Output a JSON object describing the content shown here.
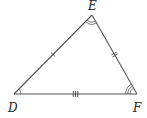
{
  "figure": {
    "type": "triangle",
    "vertices": [
      {
        "name": "D",
        "x": 14,
        "y": 94,
        "label_x": 8,
        "label_y": 112
      },
      {
        "name": "E",
        "x": 92,
        "y": 15,
        "label_x": 88,
        "label_y": 10
      },
      {
        "name": "F",
        "x": 137,
        "y": 94,
        "label_x": 133,
        "label_y": 112
      }
    ],
    "sides": [
      {
        "from": "D",
        "to": "E",
        "tick_marks": 1
      },
      {
        "from": "E",
        "to": "F",
        "tick_marks": 2
      },
      {
        "from": "D",
        "to": "F",
        "tick_marks": 3
      }
    ],
    "angles": [
      {
        "vertex": "D",
        "arc_marks": 1
      },
      {
        "vertex": "E",
        "arc_marks": 2
      },
      {
        "vertex": "F",
        "arc_marks": 3
      }
    ],
    "colors": {
      "line": "#555555",
      "label": "#222222",
      "background": "#ffffff"
    }
  }
}
